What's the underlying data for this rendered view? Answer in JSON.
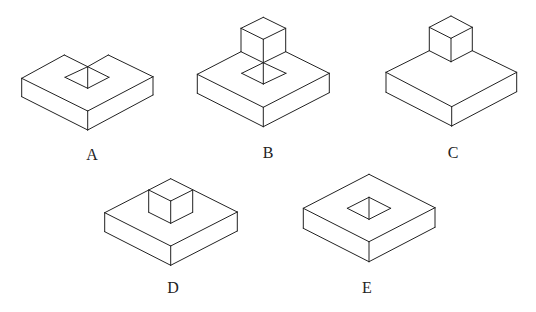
{
  "figures": [
    {
      "id": "A",
      "label": "A",
      "description": "Square slab with back corner notched and a square hole on top",
      "label_pos": [
        92,
        156
      ],
      "edges": [
        [
          [
            21.7,
            78.3
          ],
          [
            64.3,
            55
          ]
        ],
        [
          [
            64.3,
            55
          ],
          [
            87.7,
            66.7
          ]
        ],
        [
          [
            87.7,
            66.7
          ],
          [
            108.3,
            55
          ]
        ],
        [
          [
            108.3,
            55
          ],
          [
            153,
            76.7
          ]
        ],
        [
          [
            21.7,
            78.3
          ],
          [
            87.7,
            111
          ]
        ],
        [
          [
            87.7,
            111
          ],
          [
            153,
            76.7
          ]
        ],
        [
          [
            21.7,
            78.3
          ],
          [
            21.7,
            96.7
          ]
        ],
        [
          [
            21.7,
            96.7
          ],
          [
            87.7,
            130
          ]
        ],
        [
          [
            87.7,
            130
          ],
          [
            153,
            95
          ]
        ],
        [
          [
            153,
            95
          ],
          [
            153,
            76.7
          ]
        ],
        [
          [
            87.7,
            111
          ],
          [
            87.7,
            130
          ]
        ],
        [
          [
            65,
            77.3
          ],
          [
            87.7,
            66.7
          ]
        ],
        [
          [
            87.7,
            66.7
          ],
          [
            109,
            77.3
          ]
        ],
        [
          [
            109,
            77.3
          ],
          [
            87.7,
            88.3
          ]
        ],
        [
          [
            87.7,
            88.3
          ],
          [
            65,
            77.3
          ]
        ],
        [
          [
            87.7,
            66.7
          ],
          [
            87.7,
            88.3
          ]
        ]
      ]
    },
    {
      "id": "B",
      "label": "B",
      "description": "Square slab with cube on back corner and square hole below",
      "label_pos": [
        268,
        154
      ],
      "edges": [
        [
          [
            197.3,
            74.3
          ],
          [
            241,
            51.7
          ]
        ],
        [
          [
            285.7,
            51.7
          ],
          [
            329.3,
            73.3
          ]
        ],
        [
          [
            197.3,
            74.3
          ],
          [
            263.3,
            107.3
          ]
        ],
        [
          [
            263.3,
            107.3
          ],
          [
            329.3,
            73.3
          ]
        ],
        [
          [
            197.3,
            74.3
          ],
          [
            197.3,
            93.3
          ]
        ],
        [
          [
            197.3,
            93.3
          ],
          [
            263.3,
            126.7
          ]
        ],
        [
          [
            263.3,
            126.7
          ],
          [
            329.3,
            92.7
          ]
        ],
        [
          [
            329.3,
            92.7
          ],
          [
            329.3,
            73.3
          ]
        ],
        [
          [
            263.3,
            107.3
          ],
          [
            263.3,
            126.7
          ]
        ],
        [
          [
            263.3,
            17.3
          ],
          [
            241,
            28.3
          ]
        ],
        [
          [
            263.3,
            17.3
          ],
          [
            285.7,
            28.3
          ]
        ],
        [
          [
            241,
            28.3
          ],
          [
            263.3,
            39.3
          ]
        ],
        [
          [
            285.7,
            28.3
          ],
          [
            263.3,
            39.3
          ]
        ],
        [
          [
            241,
            28.3
          ],
          [
            241,
            51.7
          ]
        ],
        [
          [
            285.7,
            28.3
          ],
          [
            285.7,
            51.7
          ]
        ],
        [
          [
            263.3,
            39.3
          ],
          [
            263.3,
            62.7
          ]
        ],
        [
          [
            241,
            51.7
          ],
          [
            263.3,
            62.7
          ]
        ],
        [
          [
            285.7,
            51.7
          ],
          [
            263.3,
            62.7
          ]
        ],
        [
          [
            241.7,
            73.3
          ],
          [
            263.3,
            62.7
          ]
        ],
        [
          [
            263.3,
            62.7
          ],
          [
            286,
            73.3
          ]
        ],
        [
          [
            286,
            73.3
          ],
          [
            263.3,
            84
          ]
        ],
        [
          [
            263.3,
            84
          ],
          [
            241.7,
            73.3
          ]
        ],
        [
          [
            263.3,
            62.7
          ],
          [
            263.3,
            84
          ]
        ]
      ]
    },
    {
      "id": "C",
      "label": "C",
      "description": "Square slab with cube on back corner",
      "label_pos": [
        453,
        154
      ],
      "edges": [
        [
          [
            386,
            72.3
          ],
          [
            429.3,
            50.7
          ]
        ],
        [
          [
            472.3,
            50.7
          ],
          [
            516.7,
            72.3
          ]
        ],
        [
          [
            386,
            72.3
          ],
          [
            451.7,
            106.7
          ]
        ],
        [
          [
            451.7,
            106.7
          ],
          [
            516.7,
            72.3
          ]
        ],
        [
          [
            386,
            72.3
          ],
          [
            386,
            92.3
          ]
        ],
        [
          [
            386,
            92.3
          ],
          [
            451.7,
            126
          ]
        ],
        [
          [
            451.7,
            126
          ],
          [
            516.7,
            91.7
          ]
        ],
        [
          [
            516.7,
            91.7
          ],
          [
            516.7,
            72.3
          ]
        ],
        [
          [
            451.7,
            106.7
          ],
          [
            451.7,
            126
          ]
        ],
        [
          [
            451,
            16
          ],
          [
            429.3,
            27.3
          ]
        ],
        [
          [
            451,
            16
          ],
          [
            472.3,
            27.3
          ]
        ],
        [
          [
            429.3,
            27.3
          ],
          [
            451,
            38.3
          ]
        ],
        [
          [
            472.3,
            27.3
          ],
          [
            451,
            38.3
          ]
        ],
        [
          [
            429.3,
            27.3
          ],
          [
            429.3,
            50.7
          ]
        ],
        [
          [
            472.3,
            27.3
          ],
          [
            472.3,
            50.7
          ]
        ],
        [
          [
            451,
            38.3
          ],
          [
            451,
            61.7
          ]
        ],
        [
          [
            429.3,
            50.7
          ],
          [
            451,
            61.7
          ]
        ],
        [
          [
            472.3,
            50.7
          ],
          [
            451,
            61.7
          ]
        ]
      ]
    },
    {
      "id": "D",
      "label": "D",
      "description": "Square slab with small cube sitting at back corner top",
      "label_pos": [
        173,
        289
      ],
      "edges": [
        [
          [
            104.7,
            212.7
          ],
          [
            170.7,
            178.7
          ]
        ],
        [
          [
            170.7,
            178.7
          ],
          [
            237.3,
            212
          ]
        ],
        [
          [
            104.7,
            212.7
          ],
          [
            170.7,
            246
          ]
        ],
        [
          [
            170.7,
            246
          ],
          [
            237.3,
            212
          ]
        ],
        [
          [
            104.7,
            212.7
          ],
          [
            104.7,
            231.7
          ]
        ],
        [
          [
            104.7,
            231.7
          ],
          [
            170.7,
            265.3
          ]
        ],
        [
          [
            170.7,
            265.3
          ],
          [
            237.3,
            231
          ]
        ],
        [
          [
            237.3,
            231
          ],
          [
            237.3,
            212
          ]
        ],
        [
          [
            170.7,
            246
          ],
          [
            170.7,
            265.3
          ]
        ],
        [
          [
            148.7,
            190
          ],
          [
            170.7,
            201
          ]
        ],
        [
          [
            192.7,
            190
          ],
          [
            170.7,
            201
          ]
        ],
        [
          [
            148.7,
            190
          ],
          [
            148.7,
            212.3
          ]
        ],
        [
          [
            192.7,
            190
          ],
          [
            192.7,
            212.3
          ]
        ],
        [
          [
            170.7,
            201
          ],
          [
            170.7,
            223.3
          ]
        ],
        [
          [
            148.7,
            212.3
          ],
          [
            170.7,
            223.3
          ]
        ],
        [
          [
            192.7,
            212.3
          ],
          [
            170.7,
            223.3
          ]
        ]
      ]
    },
    {
      "id": "E",
      "label": "E",
      "description": "Square slab with square hole in center",
      "label_pos": [
        367,
        289
      ],
      "edges": [
        [
          [
            303.3,
            208.3
          ],
          [
            369,
            174.3
          ]
        ],
        [
          [
            369,
            174.3
          ],
          [
            435,
            207.7
          ]
        ],
        [
          [
            303.3,
            208.3
          ],
          [
            369,
            241.7
          ]
        ],
        [
          [
            369,
            241.7
          ],
          [
            435,
            207.7
          ]
        ],
        [
          [
            303.3,
            208.3
          ],
          [
            303.3,
            228.3
          ]
        ],
        [
          [
            303.3,
            228.3
          ],
          [
            369,
            261.7
          ]
        ],
        [
          [
            369,
            261.7
          ],
          [
            435,
            227.3
          ]
        ],
        [
          [
            435,
            227.3
          ],
          [
            435,
            207.7
          ]
        ],
        [
          [
            369,
            241.7
          ],
          [
            369,
            261.7
          ]
        ],
        [
          [
            347.3,
            208.3
          ],
          [
            369,
            197.3
          ]
        ],
        [
          [
            369,
            197.3
          ],
          [
            390.7,
            208.3
          ]
        ],
        [
          [
            390.7,
            208.3
          ],
          [
            369,
            219.3
          ]
        ],
        [
          [
            369,
            219.3
          ],
          [
            347.3,
            208.3
          ]
        ],
        [
          [
            369,
            197.3
          ],
          [
            369,
            219.3
          ]
        ]
      ]
    }
  ],
  "colors": {
    "stroke": "#222222",
    "background": "#ffffff"
  }
}
